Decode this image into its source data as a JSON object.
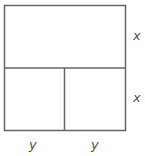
{
  "diagram": {
    "stroke_color": "#666666",
    "label_color": "#555555",
    "labels": {
      "right_top": "x",
      "right_bottom": "x",
      "bottom_left": "y",
      "bottom_right": "y"
    }
  }
}
